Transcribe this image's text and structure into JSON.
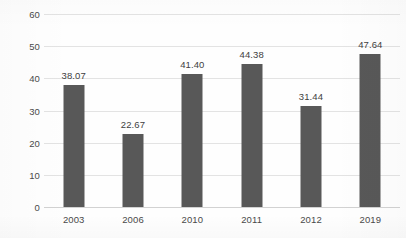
{
  "chart_data": {
    "type": "bar",
    "title": "",
    "xlabel": "",
    "ylabel": "",
    "categories": [
      "2003",
      "2006",
      "2010",
      "2011",
      "2012",
      "2019"
    ],
    "values": [
      38.07,
      22.67,
      41.4,
      44.38,
      31.44,
      47.64
    ],
    "value_labels": [
      "38.07",
      "22.67",
      "41.40",
      "44.38",
      "31.44",
      "47.64"
    ],
    "ylim": [
      0,
      60
    ],
    "ytick_values": [
      0,
      10,
      20,
      30,
      40,
      50,
      60
    ],
    "ytick_labels": [
      "0",
      "10",
      "20",
      "30",
      "40",
      "50",
      "60"
    ],
    "grid": true,
    "grid_axis": "y",
    "legend": false,
    "legend_position": "none",
    "bar_color": "#585858",
    "gridline_color": "#e3e3e3",
    "axis_color": "#d2d2d2",
    "label_color": "#3f3f3f",
    "tick_color": "#4a4a4a",
    "background_color": "#fefefe"
  }
}
